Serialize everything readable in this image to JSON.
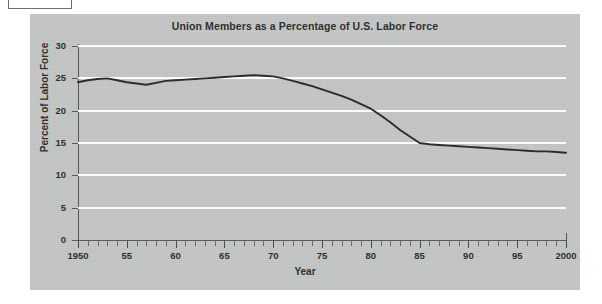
{
  "figure": {
    "background_color": "#ffffff",
    "panel_color": "#c5c7c6",
    "gridline_color": "#fbfbfb",
    "axis_color": "#58595b",
    "line_color": "#2b2d2c"
  },
  "chart_data": {
    "type": "line",
    "title": "Union Members as a Percentage of U.S. Labor Force",
    "xlabel": "Year",
    "ylabel": "Percent of Labor Force",
    "xlim": [
      1950,
      2000
    ],
    "ylim": [
      0,
      30
    ],
    "grid": true,
    "legend": "none",
    "ytick_labels": [
      "30",
      "25",
      "20",
      "15",
      "10",
      "5",
      "0"
    ],
    "ytick_values": [
      30,
      25,
      20,
      15,
      10,
      5,
      0
    ],
    "xtick_labels": [
      "1950",
      "55",
      "60",
      "65",
      "70",
      "75",
      "80",
      "85",
      "90",
      "95",
      "2000"
    ],
    "xtick_values": [
      1950,
      1955,
      1960,
      1965,
      1970,
      1975,
      1980,
      1985,
      1990,
      1995,
      2000
    ],
    "minor_xtick_interval": 1,
    "series": [
      {
        "name": "Union Members as a Percentage of U.S. Labor Force",
        "x": [
          1950,
          1951,
          1952,
          1953,
          1954,
          1955,
          1956,
          1957,
          1958,
          1959,
          1960,
          1961,
          1962,
          1963,
          1964,
          1965,
          1966,
          1967,
          1968,
          1969,
          1970,
          1971,
          1972,
          1973,
          1974,
          1975,
          1976,
          1977,
          1978,
          1979,
          1980,
          1981,
          1982,
          1983,
          1984,
          1985,
          1986,
          1987,
          1988,
          1989,
          1990,
          1991,
          1992,
          1993,
          1994,
          1995,
          1996,
          1997,
          1998,
          1999,
          2000
        ],
        "values": [
          24.4,
          24.7,
          24.9,
          25.0,
          24.7,
          24.4,
          24.2,
          24.0,
          24.3,
          24.6,
          24.7,
          24.8,
          24.9,
          25.0,
          25.1,
          25.2,
          25.3,
          25.4,
          25.5,
          25.4,
          25.3,
          25.0,
          24.6,
          24.2,
          23.8,
          23.3,
          22.8,
          22.3,
          21.7,
          21.0,
          20.3,
          19.3,
          18.2,
          17.0,
          16.0,
          15.0,
          14.8,
          14.7,
          14.6,
          14.5,
          14.4,
          14.3,
          14.2,
          14.1,
          14.0,
          13.9,
          13.8,
          13.7,
          13.7,
          13.6,
          13.5
        ]
      }
    ]
  }
}
